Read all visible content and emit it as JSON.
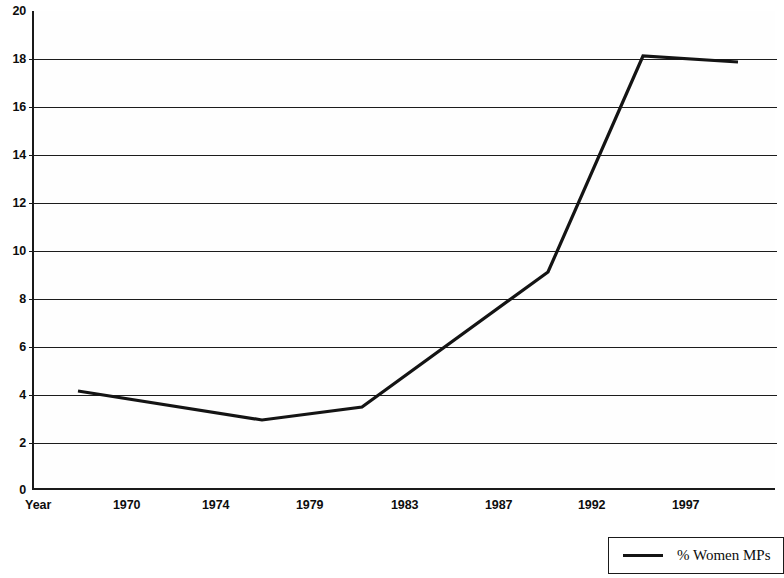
{
  "chart_data": {
    "type": "line",
    "title": "",
    "xlabel": "Year",
    "ylabel": "",
    "ylim": [
      0,
      20
    ],
    "ytick_step": 2,
    "grid": true,
    "legend_position": "bottom-right",
    "x_axis_name": "Year",
    "categories": [
      "1970",
      "1974",
      "1979",
      "1983",
      "1987",
      "1992",
      "1997"
    ],
    "tick_labels": [
      "1970",
      "1974",
      "1979",
      "1983",
      "1987",
      "1992",
      "1997"
    ],
    "ytick_labels": [
      "0",
      "2",
      "4",
      "6",
      "8",
      "10",
      "12",
      "14",
      "16",
      "18",
      "20"
    ],
    "series": [
      {
        "name": "% Women MPs",
        "color": "#141414",
        "x": [
          1966,
          1974,
          1979,
          1983,
          1992,
          1997,
          2001
        ],
        "values": [
          4.1,
          2.9,
          3.5,
          3.5,
          9.1,
          18.1,
          17.8
        ],
        "points": [
          {
            "year": "1966",
            "value": 4.1
          },
          {
            "year": "1974",
            "value": 2.9
          },
          {
            "year": "1979",
            "value": 3.5
          },
          {
            "year": "1983",
            "value": 3.5
          },
          {
            "year": "1992",
            "value": 9.1
          },
          {
            "year": "1997",
            "value": 18.1
          },
          {
            "year": "2001",
            "value": 17.8
          }
        ],
        "pixel_path": "78,391 262,420 362,407 548,272 643,56 738,62"
      }
    ],
    "legend": [
      {
        "label": "% Women MPs",
        "color": "#141414"
      }
    ]
  },
  "axes": {
    "y_ticks": [
      {
        "label": "20",
        "value": 20,
        "y": 11,
        "gridline": false
      },
      {
        "label": "18",
        "value": 18,
        "y": 59,
        "gridline": true
      },
      {
        "label": "16",
        "value": 16,
        "y": 107,
        "gridline": true
      },
      {
        "label": "14",
        "value": 14,
        "y": 155,
        "gridline": true
      },
      {
        "label": "12",
        "value": 12,
        "y": 203,
        "gridline": true
      },
      {
        "label": "10",
        "value": 10,
        "y": 251,
        "gridline": true
      },
      {
        "label": "8",
        "value": 8,
        "y": 299,
        "gridline": true
      },
      {
        "label": "6",
        "value": 6,
        "y": 347,
        "gridline": true
      },
      {
        "label": "4",
        "value": 4,
        "y": 395,
        "gridline": true
      },
      {
        "label": "2",
        "value": 2,
        "y": 443,
        "gridline": true
      },
      {
        "label": "0",
        "value": 0,
        "y": 490,
        "gridline": false
      }
    ],
    "x_ticks": [
      {
        "label": "1970",
        "x": 113
      },
      {
        "label": "1974",
        "x": 202
      },
      {
        "label": "1979",
        "x": 296
      },
      {
        "label": "1983",
        "x": 391
      },
      {
        "label": "1987",
        "x": 485
      },
      {
        "label": "1992",
        "x": 578
      },
      {
        "label": "1997",
        "x": 672
      }
    ]
  },
  "legend_entry": {
    "label": "% Women MPs"
  },
  "artifacts": {
    "speckle_top": ". .  .   .    .  ."
  }
}
